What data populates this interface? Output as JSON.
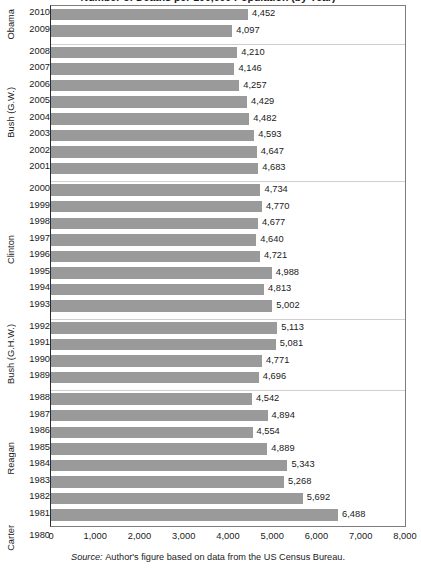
{
  "title": "Number of Deaths per 100,000 Population (by Year)",
  "source": {
    "prefix": "Source:",
    "text": "Author's figure based on data from the US Census Bureau."
  },
  "axis": {
    "ticks": [
      "0",
      "1,000",
      "2,000",
      "3,000",
      "4,000",
      "5,000",
      "6,000",
      "7,000",
      "8,000"
    ]
  },
  "colors": {
    "bar": "#9a9a9a",
    "separator": "#cfcfcf",
    "border": "#7d7d7d",
    "text": "#1a1a1a"
  },
  "groups": [
    {
      "label": "Obama",
      "rows": [
        {
          "year": "2010",
          "value": 4452,
          "value_label": "4,452"
        },
        {
          "year": "2009",
          "value": 4097,
          "value_label": "4,097"
        }
      ]
    },
    {
      "label": "Bush (G.W.)",
      "rows": [
        {
          "year": "2008",
          "value": 4210,
          "value_label": "4,210"
        },
        {
          "year": "2007",
          "value": 4146,
          "value_label": "4,146"
        },
        {
          "year": "2006",
          "value": 4257,
          "value_label": "4,257"
        },
        {
          "year": "2005",
          "value": 4429,
          "value_label": "4,429"
        },
        {
          "year": "2004",
          "value": 4482,
          "value_label": "4,482"
        },
        {
          "year": "2003",
          "value": 4593,
          "value_label": "4,593"
        },
        {
          "year": "2002",
          "value": 4647,
          "value_label": "4,647"
        },
        {
          "year": "2001",
          "value": 4683,
          "value_label": "4,683"
        }
      ]
    },
    {
      "label": "Clinton",
      "rows": [
        {
          "year": "2000",
          "value": 4734,
          "value_label": "4,734"
        },
        {
          "year": "1999",
          "value": 4770,
          "value_label": "4,770"
        },
        {
          "year": "1998",
          "value": 4677,
          "value_label": "4,677"
        },
        {
          "year": "1997",
          "value": 4640,
          "value_label": "4,640"
        },
        {
          "year": "1996",
          "value": 4721,
          "value_label": "4,721"
        },
        {
          "year": "1995",
          "value": 4988,
          "value_label": "4,988"
        },
        {
          "year": "1994",
          "value": 4813,
          "value_label": "4,813"
        },
        {
          "year": "1993",
          "value": 5002,
          "value_label": "5,002"
        }
      ]
    },
    {
      "label": "Bush (G.H.W.)",
      "rows": [
        {
          "year": "1992",
          "value": 5113,
          "value_label": "5,113"
        },
        {
          "year": "1991",
          "value": 5081,
          "value_label": "5,081"
        },
        {
          "year": "1990",
          "value": 4771,
          "value_label": "4,771"
        },
        {
          "year": "1989",
          "value": 4696,
          "value_label": "4,696"
        }
      ]
    },
    {
      "label": "Reagan",
      "rows": [
        {
          "year": "1988",
          "value": 4542,
          "value_label": "4,542"
        },
        {
          "year": "1987",
          "value": 4894,
          "value_label": "4,894"
        },
        {
          "year": "1986",
          "value": 4554,
          "value_label": "4,554"
        },
        {
          "year": "1985",
          "value": 4889,
          "value_label": "4,889"
        },
        {
          "year": "1984",
          "value": 5343,
          "value_label": "5,343"
        },
        {
          "year": "1983",
          "value": 5268,
          "value_label": "5,268"
        },
        {
          "year": "1982",
          "value": 5692,
          "value_label": "5,692"
        },
        {
          "year": "1981",
          "value": 6488,
          "value_label": "6,488"
        }
      ]
    },
    {
      "label": "Carter",
      "rows": [
        {
          "year": "1980",
          "value": 7364,
          "value_label": "7,364"
        }
      ]
    }
  ],
  "chart_data": {
    "type": "bar",
    "orientation": "horizontal",
    "title": "Number of Deaths per 100,000 Population (by Year)",
    "xlabel": "",
    "ylabel": "",
    "xlim": [
      0,
      8000
    ],
    "xticks": [
      0,
      1000,
      2000,
      3000,
      4000,
      5000,
      6000,
      7000,
      8000
    ],
    "grid": false,
    "legend": false,
    "bar_color": "#9a9a9a",
    "data_labels": true,
    "note": "Source: Author's figure based on data from the US Census Bureau.",
    "group_field": "president",
    "categories": [
      "2010",
      "2009",
      "2008",
      "2007",
      "2006",
      "2005",
      "2004",
      "2003",
      "2002",
      "2001",
      "2000",
      "1999",
      "1998",
      "1997",
      "1996",
      "1995",
      "1994",
      "1993",
      "1992",
      "1991",
      "1990",
      "1989",
      "1988",
      "1987",
      "1986",
      "1985",
      "1984",
      "1983",
      "1982",
      "1981",
      "1980"
    ],
    "values": [
      4452,
      4097,
      4210,
      4146,
      4257,
      4429,
      4482,
      4593,
      4647,
      4683,
      4734,
      4770,
      4677,
      4640,
      4721,
      4988,
      4813,
      5002,
      5113,
      5081,
      4771,
      4696,
      4542,
      4894,
      4554,
      4889,
      5343,
      5268,
      5692,
      6488,
      7364
    ],
    "groups": [
      {
        "president": "Obama",
        "years": [
          "2010",
          "2009"
        ],
        "values": [
          4452,
          4097
        ]
      },
      {
        "president": "Bush (G.W.)",
        "years": [
          "2008",
          "2007",
          "2006",
          "2005",
          "2004",
          "2003",
          "2002",
          "2001"
        ],
        "values": [
          4210,
          4146,
          4257,
          4429,
          4482,
          4593,
          4647,
          4683
        ]
      },
      {
        "president": "Clinton",
        "years": [
          "2000",
          "1999",
          "1998",
          "1997",
          "1996",
          "1995",
          "1994",
          "1993"
        ],
        "values": [
          4734,
          4770,
          4677,
          4640,
          4721,
          4988,
          4813,
          5002
        ]
      },
      {
        "president": "Bush (G.H.W.)",
        "years": [
          "1992",
          "1991",
          "1990",
          "1989"
        ],
        "values": [
          5113,
          5081,
          4771,
          4696
        ]
      },
      {
        "president": "Reagan",
        "years": [
          "1988",
          "1987",
          "1986",
          "1985",
          "1984",
          "1983",
          "1982",
          "1981"
        ],
        "values": [
          4542,
          4894,
          4554,
          4889,
          5343,
          5268,
          5692,
          6488
        ]
      },
      {
        "president": "Carter",
        "years": [
          "1980"
        ],
        "values": [
          7364
        ]
      }
    ]
  }
}
